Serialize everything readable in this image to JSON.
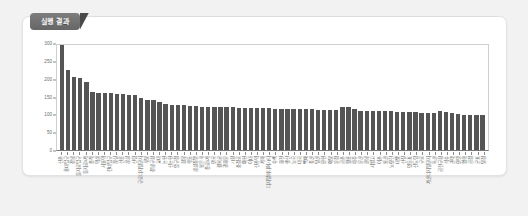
{
  "panel": {
    "tab_label": "실행 결과",
    "accent_color": "#666666",
    "bar_color": "#555555",
    "card_background": "#ffffff",
    "page_background": "#f2f2f2"
  },
  "chart_data": {
    "type": "bar",
    "title": "",
    "xlabel": "",
    "ylabel": "",
    "ylim": [
      0,
      300
    ],
    "yticks": [
      0,
      50,
      100,
      150,
      200,
      250,
      300
    ],
    "grid": false,
    "legend": null,
    "categories": [
      "신촌",
      "홍대입구",
      "강남",
      "을지로입구",
      "을지로3가",
      "종각",
      "역삼",
      "서울역",
      "건대입구",
      "잠실",
      "선릉",
      "삼성",
      "신림",
      "구로디지털단지",
      "사당",
      "강남구청",
      "교대",
      "논현",
      "신논현",
      "압구정",
      "청담",
      "학동",
      "삼성중앙",
      "봉은사",
      "종로3가",
      "안국",
      "경복궁",
      "광화문",
      "시청",
      "충정로",
      "아현",
      "이대",
      "신촌역",
      "가좌",
      "디지털미디어시티",
      "수색",
      "화전",
      "행신",
      "능곡",
      "대곡",
      "백마",
      "풍산",
      "일산",
      "탄현",
      "야당",
      "운정",
      "금촌",
      "월롱",
      "파주",
      "문산",
      "한남",
      "서빙고",
      "이촌",
      "용산",
      "노량진",
      "대방",
      "신길",
      "영등포",
      "신도림",
      "구로",
      "가산디지털단지",
      "독산",
      "금천구청",
      "석수",
      "관악",
      "안양",
      "명학",
      "금정",
      "군포",
      "당정"
    ],
    "values": [
      295,
      223,
      204,
      202,
      192,
      164,
      160,
      160,
      159,
      158,
      157,
      155,
      153,
      146,
      141,
      141,
      134,
      128,
      127,
      126,
      125,
      124,
      123,
      122,
      122,
      121,
      120,
      120,
      120,
      119,
      119,
      118,
      118,
      117,
      117,
      116,
      116,
      115,
      115,
      115,
      114,
      114,
      113,
      113,
      113,
      112,
      120,
      121,
      115,
      110,
      110,
      109,
      109,
      108,
      108,
      107,
      107,
      106,
      106,
      105,
      104,
      104,
      108,
      107,
      103,
      100,
      99,
      99,
      98,
      97
    ]
  }
}
